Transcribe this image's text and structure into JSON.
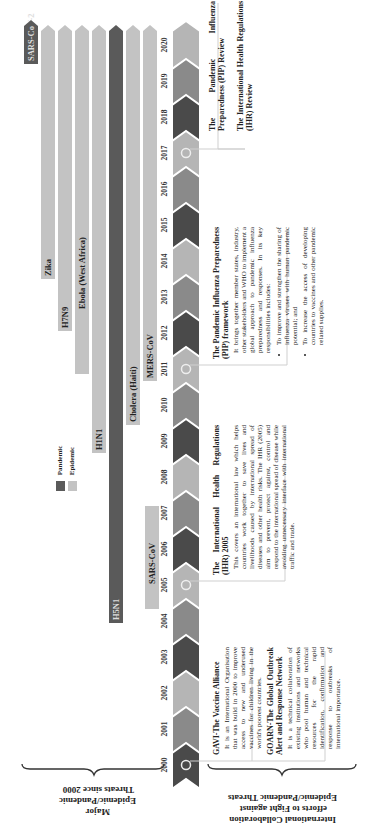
{
  "legend": {
    "pandemic_label": "Pandemic",
    "epidemic_label": "Epidemic",
    "pandemic_color": "#5a5a5a",
    "epidemic_color": "#c3c3c3"
  },
  "timeline": {
    "years": [
      "2000",
      "2001",
      "2002",
      "2003",
      "2004",
      "2005",
      "2006",
      "2007",
      "2008",
      "2009",
      "2010",
      "2011",
      "2012",
      "2013",
      "2014",
      "2015",
      "2016",
      "2017",
      "2018",
      "2019",
      "2020"
    ],
    "chevron_colors": [
      "#4a4a4a",
      "#8a8a8a",
      "#b5b5b5",
      "#4a4a4a",
      "#8a8a8a",
      "#b5b5b5",
      "#4a4a4a",
      "#8a8a8a",
      "#b5b5b5",
      "#4a4a4a",
      "#8a8a8a",
      "#b5b5b5",
      "#4a4a4a",
      "#8a8a8a",
      "#b5b5b5",
      "#4a4a4a",
      "#8a8a8a",
      "#b5b5b5",
      "#4a4a4a",
      "#8a8a8a",
      "#b5b5b5"
    ]
  },
  "threats": [
    {
      "name": "SARS-CoV-2",
      "type": "pandemic",
      "start": 2019.9,
      "end": 2020.6
    },
    {
      "name": "Zika",
      "type": "epidemic",
      "start": 2014.8,
      "end": 2020.6
    },
    {
      "name": "H7N9",
      "type": "epidemic",
      "start": 2012.8,
      "end": 2020.6
    },
    {
      "name": "Ebola (West Africa)",
      "type": "epidemic",
      "start": 2013.5,
      "end": 2020.6
    },
    {
      "name": "H1N1",
      "type": "epidemic",
      "start": 2008.8,
      "end": 2020.6
    },
    {
      "name": "H5N1",
      "type": "pandemic",
      "start": 2003.8,
      "end": 2020.6
    },
    {
      "name": "Cholera (Haiti)",
      "type": "epidemic",
      "start": 2010.0,
      "end": 2020.6
    },
    {
      "name": "MERS-CoV",
      "type": "epidemic",
      "start": 2012.1,
      "end": 2020.6
    },
    {
      "name": "SARS-CoV",
      "type": "epidemic",
      "start": 2002.1,
      "end": 2004.8
    }
  ],
  "efforts": {
    "gavi": {
      "title": "GAVI-The Vaccine Alliance",
      "body": "It is an International Organisation that was build in 2000 to improve access to new and underused vaccines for children living in the world's poorest countries."
    },
    "goarn": {
      "title": "GOARN-The Global Outbreak Alert and Response Network",
      "body": "It is a technical collaboration of existing institutions and networks who pool human and technical resources for the rapid identification, confirmation and response to outbreaks of international importance."
    },
    "ihr2005": {
      "title": "The International Health Regulations (IHR) 2005",
      "body": "This covers an international law which helps countries work together to save lives and livelihoods caused by international spread of diseases and other health risks. The IHR (2005) aim to prevent, protect against, control and respond to the international spread of disease while avoiding unnecessary interface with international traffic and trade."
    },
    "pip": {
      "title": "The Pandemic Influenza Preparedness (PIP) framework",
      "body": "It brings together member states, industry, other stakeholders and WHO to implement a global approach to pandemic influenza preparedness and responses. In its key responsibilities includes:",
      "bullets": [
        "To improve and strengthen the sharing of influenza viruses with human pandemic potential; and",
        "To increase the access of developing countries to vaccines and other pandemic related supplies."
      ]
    },
    "reviews": {
      "pip_review": "The Pandemic Influenza Preparedness (PIP) Review",
      "ihr_review": "The International Health Regulations (IHR) Review"
    }
  },
  "captions": {
    "left": "Major Epidemic/Pandemic Threats since 2000",
    "right": "International Collaboration efforts to Fight against Epidemic/Pandemic Threats"
  }
}
